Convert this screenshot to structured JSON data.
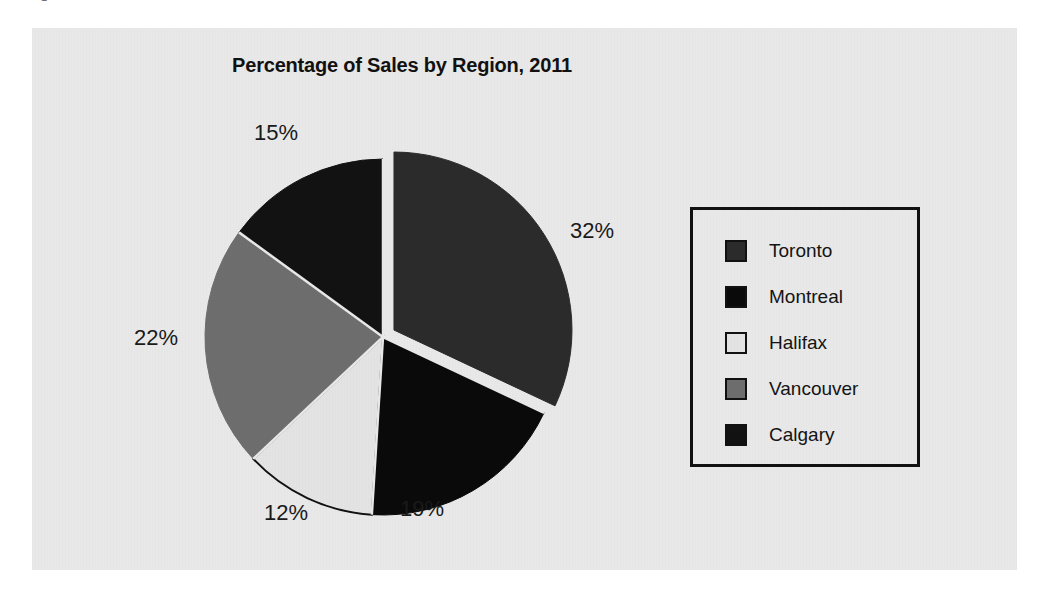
{
  "caption": {
    "number": "Figure",
    "kind": "Pie Chart"
  },
  "figure": {
    "title": "Percentage of Sales by Region, 2011",
    "panel_bg": "#e9e9e9"
  },
  "legend": {
    "position": "right",
    "items": [
      {
        "label": "Toronto",
        "color": "#2b2b2b"
      },
      {
        "label": "Montreal",
        "color": "#0a0a0a"
      },
      {
        "label": "Halifax",
        "color": "#e4e4e4"
      },
      {
        "label": "Vancouver",
        "color": "#6e6e6e"
      },
      {
        "label": "Calgary",
        "color": "#121212"
      }
    ]
  },
  "labels": {
    "toronto": "32%",
    "montreal": "19%",
    "halifax": "12%",
    "vancouver": "22%",
    "calgary": "15%"
  },
  "chart_data": {
    "type": "pie",
    "title": "Percentage of Sales by Region, 2011",
    "xlabel": "",
    "ylabel": "",
    "unit": "%",
    "total": 100,
    "start_angle_deg": 0,
    "direction": "clockwise",
    "legend_position": "right",
    "grid": false,
    "exploded_slices": [
      "Toronto"
    ],
    "categories": [
      "Toronto",
      "Montreal",
      "Halifax",
      "Vancouver",
      "Calgary"
    ],
    "values": [
      32,
      19,
      12,
      22,
      15
    ],
    "colors": [
      "#2b2b2b",
      "#0a0a0a",
      "#e4e4e4",
      "#6e6e6e",
      "#121212"
    ],
    "data_labels": [
      "32%",
      "19%",
      "12%",
      "22%",
      "15%"
    ],
    "slices": [
      {
        "name": "Toronto",
        "value": 32,
        "label": "32%",
        "color": "#2b2b2b",
        "exploded": true
      },
      {
        "name": "Montreal",
        "value": 19,
        "label": "19%",
        "color": "#0a0a0a",
        "exploded": false
      },
      {
        "name": "Halifax",
        "value": 12,
        "label": "12%",
        "color": "#e4e4e4",
        "exploded": false
      },
      {
        "name": "Vancouver",
        "value": 22,
        "label": "22%",
        "color": "#6e6e6e",
        "exploded": false
      },
      {
        "name": "Calgary",
        "value": 15,
        "label": "15%",
        "color": "#121212",
        "exploded": false
      }
    ]
  }
}
